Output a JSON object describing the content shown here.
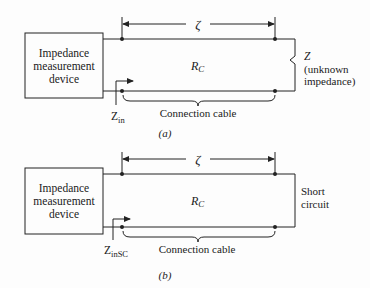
{
  "figures": [
    {
      "id": "a",
      "caption": "(a)",
      "device_label": [
        "Impedance",
        "measurement",
        "device"
      ],
      "length_symbol": "ζ",
      "cable_resistance": {
        "main": "R",
        "sub": "C"
      },
      "cable_label": "Connection cable",
      "input_impedance": {
        "main": "Z",
        "sub": "in"
      },
      "load": {
        "type": "unknown-impedance",
        "symbol": "Z",
        "lines": [
          "(unknown",
          "impedance)"
        ]
      }
    },
    {
      "id": "b",
      "caption": "(b)",
      "device_label": [
        "Impedance",
        "measurement",
        "device"
      ],
      "length_symbol": "ζ",
      "cable_resistance": {
        "main": "R",
        "sub": "C"
      },
      "cable_label": "Connection cable",
      "input_impedance": {
        "main": "Z",
        "sub": "inSC"
      },
      "load": {
        "type": "short-circuit",
        "lines": [
          "Short",
          "circuit"
        ]
      }
    }
  ],
  "colors": {
    "line": "#222222",
    "background": "#fdfdfd"
  }
}
